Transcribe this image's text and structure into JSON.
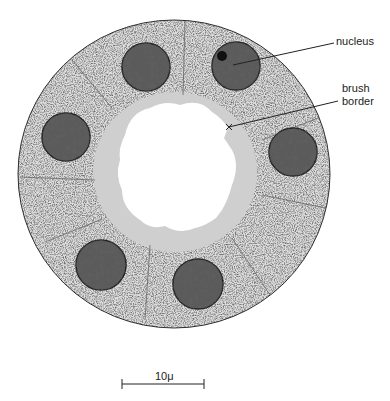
{
  "figure": {
    "type": "cross-section of tubule",
    "labels": {
      "nucleus": "nucleus",
      "brush_border_line1": "brush",
      "brush_border_line2": "border"
    },
    "scale_bar": {
      "label": "10μ"
    },
    "colors": {
      "cytoplasm": "#d9d9d9",
      "brush_border": "#c9c9c9",
      "nucleus": "#5a5a5a",
      "outline": "#333333",
      "lumen": "#ffffff"
    },
    "cell_count": 6
  }
}
